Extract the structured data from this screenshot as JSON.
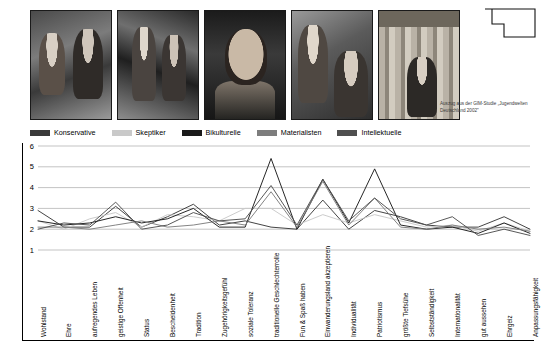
{
  "source_note": "Auszug aus der GIM-Studie „Jugendwelten Deutschland 2002\"",
  "photos": [
    {
      "alt": "zwei-junge-frauen-strasse"
    },
    {
      "alt": "gruppe-party-disco"
    },
    {
      "alt": "junger-mann-portrait"
    },
    {
      "alt": "zwei-junge-frauen-blumenkranz"
    },
    {
      "alt": "junge-frau-bibliothek"
    }
  ],
  "legend": {
    "items": [
      {
        "label": "Konservative",
        "color": "#3a3a3a"
      },
      {
        "label": "Skeptiker",
        "color": "#c9c9c9"
      },
      {
        "label": "Bikulturelle",
        "color": "#1a1a1a"
      },
      {
        "label": "Materialisten",
        "color": "#7d7d7d"
      },
      {
        "label": "Intellektuelle",
        "color": "#4f4f4f"
      }
    ]
  },
  "chart_data": {
    "type": "line",
    "title": "",
    "xlabel": "",
    "ylabel": "",
    "ylim": [
      1,
      6
    ],
    "yticks": [
      1,
      2,
      3,
      4,
      5,
      6
    ],
    "grid": true,
    "legend_position": "top",
    "categories": [
      "Wohlstand",
      "Ehre",
      "aufregendes Leben",
      "geistige Offenheit",
      "Status",
      "Bescheidenheit",
      "Tradition",
      "Zugehörigkeitsgefühl",
      "soziale Toleranz",
      "traditionelle Geschlechterrolle",
      "Fun & Spaß haben",
      "Einwanderungsland akzeptieren",
      "Individualität",
      "Patriotismus",
      "größte Tiefsühe",
      "Selbstständigkeit",
      "Internationalität",
      "gut aussehen",
      "Ehrgeiz",
      "Anpassungsfähigkeit"
    ],
    "series": [
      {
        "name": "Konservative",
        "color": "#3a3a3a",
        "values": [
          2.9,
          2.1,
          2.1,
          3.1,
          2.1,
          2.6,
          3.2,
          2.2,
          2.4,
          2.1,
          2.0,
          3.4,
          2.0,
          2.9,
          2.6,
          2.2,
          2.1,
          2.1,
          2.6,
          2.0
        ]
      },
      {
        "name": "Skeptiker",
        "color": "#c9c9c9",
        "values": [
          2.4,
          2.0,
          2.5,
          2.8,
          2.1,
          2.7,
          2.6,
          2.4,
          3.0,
          3.0,
          2.2,
          2.7,
          2.3,
          2.7,
          2.4,
          2.1,
          2.2,
          1.9,
          2.3,
          1.9
        ]
      },
      {
        "name": "Bikulturelle",
        "color": "#1a1a1a",
        "values": [
          2.4,
          2.2,
          2.3,
          2.6,
          2.3,
          2.5,
          3.0,
          2.1,
          2.1,
          5.4,
          2.0,
          4.4,
          2.3,
          4.9,
          2.2,
          2.0,
          2.1,
          1.8,
          2.3,
          1.8
        ]
      },
      {
        "name": "Materialisten",
        "color": "#7d7d7d",
        "values": [
          2.1,
          2.1,
          2.0,
          2.2,
          2.4,
          2.1,
          2.2,
          2.4,
          2.2,
          3.8,
          2.1,
          4.3,
          2.2,
          3.5,
          2.1,
          2.0,
          2.2,
          2.0,
          2.1,
          1.9
        ]
      },
      {
        "name": "Intellektuelle",
        "color": "#4f4f4f",
        "values": [
          2.0,
          2.3,
          2.2,
          3.3,
          2.0,
          2.2,
          2.8,
          2.4,
          2.5,
          4.1,
          2.2,
          4.4,
          2.4,
          3.5,
          2.5,
          2.2,
          2.6,
          1.7,
          2.0,
          1.7
        ]
      }
    ]
  }
}
